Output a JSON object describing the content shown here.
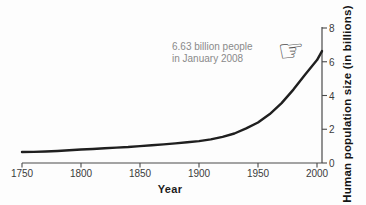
{
  "chart_data": {
    "type": "line",
    "title": "",
    "xlabel": "Year",
    "ylabel": "Human population size (in billions)",
    "x_ticks": [
      "1750",
      "1800",
      "1850",
      "1900",
      "1950",
      "2000"
    ],
    "y_ticks": [
      "0",
      "2",
      "4",
      "6",
      "8"
    ],
    "xlim": [
      1750,
      2008
    ],
    "ylim": [
      0,
      8
    ],
    "grid": false,
    "legend": "none",
    "series": [
      {
        "name": "Human population size",
        "points": [
          [
            1750,
            0.65
          ],
          [
            1760,
            0.66
          ],
          [
            1770,
            0.68
          ],
          [
            1780,
            0.71
          ],
          [
            1790,
            0.75
          ],
          [
            1800,
            0.8
          ],
          [
            1810,
            0.83
          ],
          [
            1820,
            0.87
          ],
          [
            1830,
            0.91
          ],
          [
            1840,
            0.95
          ],
          [
            1850,
            1.0
          ],
          [
            1860,
            1.05
          ],
          [
            1870,
            1.1
          ],
          [
            1880,
            1.16
          ],
          [
            1890,
            1.23
          ],
          [
            1900,
            1.3
          ],
          [
            1910,
            1.4
          ],
          [
            1920,
            1.55
          ],
          [
            1930,
            1.75
          ],
          [
            1940,
            2.05
          ],
          [
            1950,
            2.4
          ],
          [
            1960,
            2.9
          ],
          [
            1970,
            3.55
          ],
          [
            1980,
            4.35
          ],
          [
            1990,
            5.25
          ],
          [
            2000,
            6.1
          ],
          [
            2008,
            6.63
          ]
        ]
      }
    ],
    "annotation": {
      "line1": "6.63 billion people",
      "line2": "in January 2008",
      "target_x": 2008,
      "target_y": 6.63
    },
    "colors": {
      "curve": "#1f1f1f",
      "axis": "#4a4a4a",
      "tick_label": "#3b3b3b",
      "axis_title": "#141414",
      "annotation_text": "#8a8a8a",
      "hand_icon": "#4f4f4f",
      "background": "#fdfdfd"
    }
  },
  "icons": {
    "pointing_hand": "☞"
  }
}
